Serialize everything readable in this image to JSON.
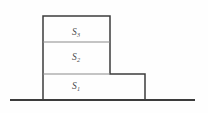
{
  "figure": {
    "background_color": "#fefefe",
    "line_color": "#3c3c3c",
    "inner_line_color": "#8a8a8a",
    "label_color": "#4a4a4a",
    "ground": {
      "label": "ground-line",
      "x1": 10,
      "x2": 195,
      "y": 100,
      "thickness": 2,
      "color": "#3c3c3c"
    },
    "blocks": [
      {
        "name": "block-s3",
        "symbol": "S",
        "subscript": "3",
        "label_x": 76,
        "label_y": 33,
        "left": 43,
        "right": 110,
        "top": 16,
        "bottom": 42
      },
      {
        "name": "block-s2",
        "symbol": "S",
        "subscript": "2",
        "label_x": 76,
        "label_y": 58,
        "left": 43,
        "right": 110,
        "top": 42,
        "bottom": 74
      },
      {
        "name": "block-s1",
        "symbol": "S",
        "subscript": "1",
        "label_x": 76,
        "label_y": 87,
        "left": 43,
        "right": 145,
        "top": 74,
        "bottom": 100
      }
    ],
    "outline_path": "M43,100 L43,16 L110,16 L110,74 L145,74 L145,100",
    "dividers": [
      {
        "name": "divider-s3-s2",
        "x1": 43,
        "x2": 110,
        "y": 42
      },
      {
        "name": "divider-s2-s1",
        "x1": 43,
        "x2": 110,
        "y": 74
      }
    ]
  },
  "chart_data": {
    "type": "diagram",
    "elements": [
      "S1",
      "S2",
      "S3",
      "ground line"
    ]
  }
}
